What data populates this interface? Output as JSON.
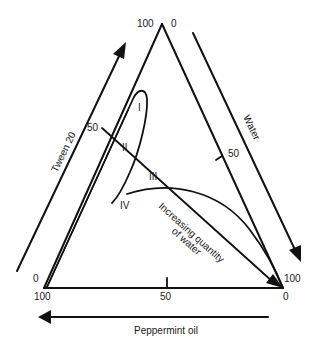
{
  "diagram": {
    "type": "ternary-phase-diagram",
    "components": {
      "top": "Tween 20",
      "right": "Water",
      "bottom": "Peppermint oil"
    },
    "axis_labels": {
      "tween": "Tween 20",
      "water": "Water",
      "oil": "Peppermint oil"
    },
    "ticks": {
      "apex_left": "100",
      "apex_right": "0",
      "left_mid": "50",
      "right_mid": "50",
      "bottom_mid": "50",
      "bottom_left_upper": "0",
      "bottom_left_lower": "100",
      "bottom_right_upper": "100",
      "bottom_right_lower": "0"
    },
    "regions": {
      "r1": "I",
      "r2": "II",
      "r3": "III",
      "r4": "IV"
    },
    "annotation": {
      "line1": "Increasing quantity",
      "line2": "of water"
    },
    "colors": {
      "stroke": "#111111",
      "background": "#ffffff"
    }
  }
}
